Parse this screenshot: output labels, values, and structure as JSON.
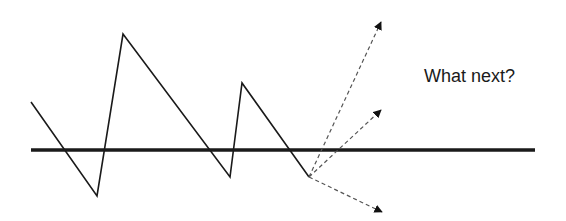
{
  "diagram": {
    "title_text": "What next?",
    "baseline": {
      "x1": 31,
      "y": 150,
      "x2": 535,
      "color": "#1a1a1a",
      "width": 3.5
    },
    "price_path": {
      "points": [
        [
          31,
          102
        ],
        [
          97,
          196
        ],
        [
          123,
          34
        ],
        [
          230,
          177
        ],
        [
          242,
          83
        ],
        [
          309,
          177
        ]
      ],
      "color": "#1a1a1a"
    },
    "projections": [
      {
        "name": "up-strong",
        "from": [
          309,
          177
        ],
        "to": [
          381,
          22
        ]
      },
      {
        "name": "up-moderate",
        "from": [
          309,
          177
        ],
        "to": [
          381,
          110
        ]
      },
      {
        "name": "down",
        "from": [
          309,
          177
        ],
        "to": [
          382,
          212
        ]
      }
    ],
    "dash_color": "#555555"
  }
}
